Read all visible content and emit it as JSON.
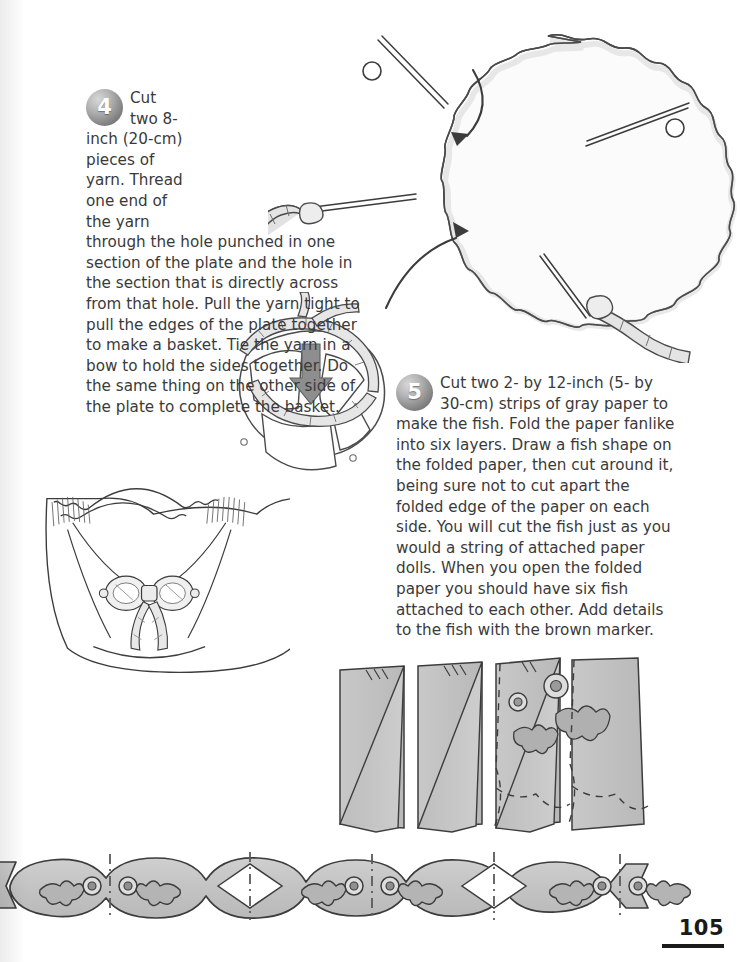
{
  "page": {
    "number": "105",
    "paper_color": "#ffffff",
    "ink_color": "#3a3a3a",
    "paper_gray": "#c6c6c6",
    "outline_color": "#3c3c3c"
  },
  "steps": [
    {
      "number": "4",
      "text": "Cut two 8-inch (20-cm) pieces of yarn. Thread one end of the yarn through the hole punched in one section of the plate and the hole in the section that is directly across from that hole. Pull the yarn tight to pull the edges of the plate together to make a basket. Tie the yarn in a bow to hold the sides together. Do the same thing on the other side of the plate to complete the basket."
    },
    {
      "number": "5",
      "text": "Cut two 2- by 12-inch (5- by 30-cm) strips of gray paper to make the fish. Fold the paper fanlike into six layers. Draw a fish shape on the folded paper, then cut around it, being sure not to cut apart the folded edge of the paper on each side. You will cut the fish just as you would a string of attached paper dolls. When you open the folded paper you should have six fish attached to each other. Add details to the fish with the brown marker."
    }
  ],
  "illustrations": [
    {
      "id": "plate-with-yarn",
      "caption": "Paper plate seen from above with four radial cuts, two punched holes, yarn threaded through two holes, and curved arrows showing the sections folding inward"
    },
    {
      "id": "plate-folding",
      "caption": "Plate partly folded up with yarn laced around the rim and a gray arrow pointing down into the basket"
    },
    {
      "id": "finished-basket",
      "caption": "Finished paper plate basket with the yarn tied in a bow at the front"
    },
    {
      "id": "folded-fish-strip",
      "caption": "Gray paper strip fan-folded into six accordion layers with a fish drawn on the top layer and dashed cut lines"
    },
    {
      "id": "fish-chain",
      "caption": "Opened strip showing six fish attached head to tail in a chain with eyes and fins, dash-dot fold lines and diamond gaps between them"
    }
  ]
}
